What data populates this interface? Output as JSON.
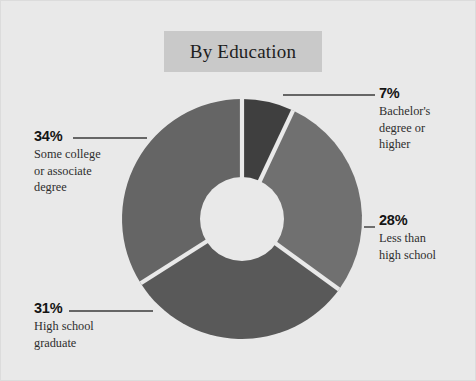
{
  "title": "By Education",
  "background_color": "#e9e9e9",
  "title_band_color": "#c9c9c9",
  "chart_data": {
    "type": "pie",
    "variant": "donut",
    "title": "By Education",
    "xlabel": "",
    "ylabel": "",
    "units": "percent",
    "legend_position": "callout-labels",
    "grid": false,
    "start_angle_deg": 0,
    "direction": "clockwise",
    "categories": [
      "Bachelor's degree or higher",
      "Less than high school",
      "High school graduate",
      "Some college or associate degree"
    ],
    "values": [
      7,
      28,
      31,
      34
    ],
    "value_labels": [
      "7%",
      "28%",
      "31%",
      "34%"
    ],
    "colors": [
      "#3f3f3f",
      "#707070",
      "#595959",
      "#656565"
    ]
  },
  "slices": [
    {
      "id": "bachelors",
      "percent_label": "7%",
      "description": "Bachelor's\ndegree or\nhigher",
      "value": 7,
      "color": "#3f3f3f"
    },
    {
      "id": "less-than-high-school",
      "percent_label": "28%",
      "description": "Less than\nhigh school",
      "value": 28,
      "color": "#707070"
    },
    {
      "id": "high-school-graduate",
      "percent_label": "31%",
      "description": "High school\ngraduate",
      "value": 31,
      "color": "#595959"
    },
    {
      "id": "some-college",
      "percent_label": "34%",
      "description": "Some college\nor associate\ndegree",
      "value": 34,
      "color": "#656565"
    }
  ]
}
